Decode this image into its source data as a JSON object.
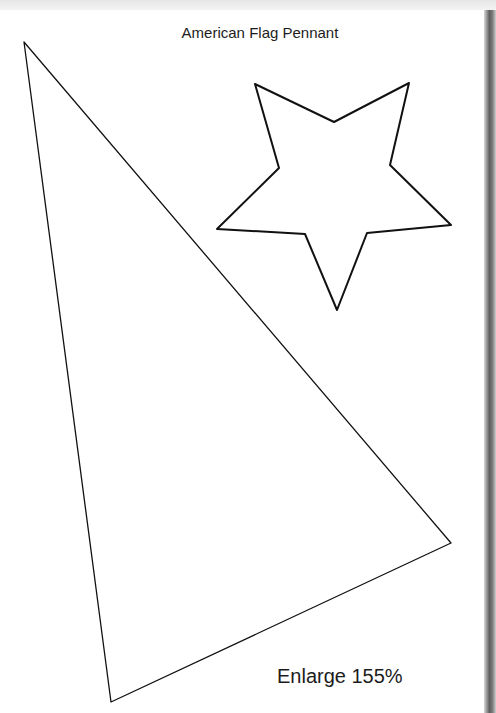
{
  "document": {
    "title": "American Flag Pennant",
    "caption": "Enlarge 155%"
  },
  "shapes": {
    "pennant": {
      "type": "triangle",
      "points": "24,42 451,543 111,702",
      "stroke": "#111111"
    },
    "star": {
      "type": "five-point-star",
      "points": "255,84 334,122 409,83 390,165 451,225 367,233 337,310 305,234 217,229 279,168",
      "stroke": "#111111"
    }
  },
  "colors": {
    "page_background": "#ffffff",
    "outer_background": "#efefef",
    "ink": "#111111"
  }
}
